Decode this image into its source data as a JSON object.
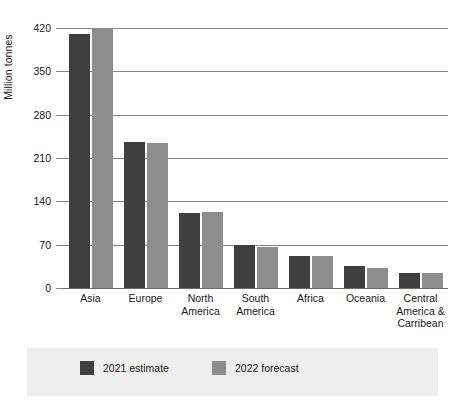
{
  "chart_data": {
    "type": "bar",
    "title": "",
    "subtitle": "",
    "xlabel": "",
    "ylabel": "Million tonnes",
    "ylim": [
      0,
      420
    ],
    "yticks": [
      0,
      70,
      140,
      210,
      280,
      350,
      420
    ],
    "ytick_labels": [
      "0",
      "70",
      "140",
      "210",
      "280",
      "350",
      "420"
    ],
    "grid": true,
    "legend_position": "bottom",
    "categories": [
      "Asia",
      "Europe",
      "North America",
      "South America",
      "Africa",
      "Oceania",
      "Central America & Carribean"
    ],
    "category_label_lines": [
      [
        "Asia"
      ],
      [
        "Europe"
      ],
      [
        "North",
        "America"
      ],
      [
        "South",
        "America"
      ],
      [
        "Africa"
      ],
      [
        "Oceania"
      ],
      [
        "Central",
        "America &",
        "Carribean"
      ]
    ],
    "series": [
      {
        "name": "2021 estimate",
        "color": "#3f3f3f",
        "values": [
          410,
          236,
          121,
          70,
          52,
          35,
          24
        ]
      },
      {
        "name": "2022 forecast",
        "color": "#8d8d8d",
        "values": [
          420,
          235,
          123,
          66,
          52,
          32,
          24
        ]
      }
    ]
  },
  "legend": {
    "items": [
      {
        "label": "2021 estimate",
        "color": "#3f3f3f"
      },
      {
        "label": "2022 forecast",
        "color": "#8d8d8d"
      }
    ]
  },
  "colors": {
    "series_2021": "#3f3f3f",
    "series_2022": "#8d8d8d",
    "gridline": "#848484",
    "legend_background": "#efefef",
    "background": "#ffffff",
    "text": "#1a1a1a"
  }
}
